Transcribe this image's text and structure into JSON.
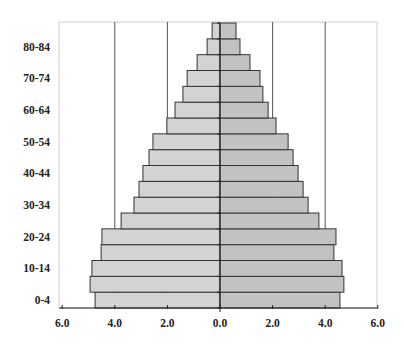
{
  "chart_data": {
    "type": "bar",
    "subtype": "population-pyramid",
    "title": "",
    "xlabel": "",
    "ylabel": "",
    "categories": [
      "0-4",
      "5-9",
      "10-14",
      "15-19",
      "20-24",
      "25-29",
      "30-34",
      "35-39",
      "40-44",
      "45-49",
      "50-54",
      "55-59",
      "60-64",
      "65-69",
      "70-74",
      "75-79",
      "80-84",
      "85+"
    ],
    "ytick_labels": [
      "0-4",
      "10-14",
      "20-24",
      "30-34",
      "40-44",
      "50-54",
      "60-64",
      "70-74",
      "80-84"
    ],
    "series": [
      {
        "name": "Left (Males)",
        "side": "left",
        "color": "#d3d3d3",
        "values": [
          4.75,
          4.94,
          4.87,
          4.52,
          4.49,
          3.76,
          3.27,
          3.08,
          2.93,
          2.7,
          2.55,
          2.02,
          1.71,
          1.41,
          1.25,
          0.87,
          0.49,
          0.3
        ]
      },
      {
        "name": "Right (Females)",
        "side": "right",
        "color": "#c2c2c2",
        "values": [
          4.56,
          4.71,
          4.64,
          4.33,
          4.41,
          3.76,
          3.35,
          3.16,
          2.97,
          2.78,
          2.59,
          2.13,
          1.83,
          1.63,
          1.52,
          1.14,
          0.76,
          0.61
        ]
      }
    ],
    "xticks": [
      -6,
      -4,
      -2,
      0,
      2,
      4,
      6
    ],
    "xtick_labels": [
      "6.0",
      "4.0",
      "2.0",
      "0.0",
      "2.0",
      "4.0",
      "6.0"
    ],
    "xlim": [
      -6,
      6
    ],
    "grid": {
      "vertical_at": [
        -4,
        -2,
        2,
        4
      ],
      "color": "#555555"
    },
    "legend": null,
    "bar_edge_color": "#333333",
    "plot_border_color": "#cccccc"
  }
}
